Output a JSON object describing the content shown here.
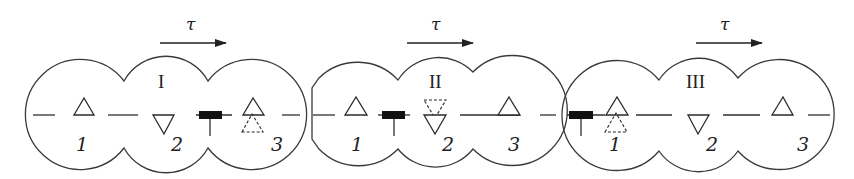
{
  "diagram": {
    "direction_symbol": "τ",
    "stroke_color": "#2a2a2a",
    "block_color": "#111111",
    "panels": [
      {
        "label": "I",
        "positions": [
          "1",
          "2",
          "3"
        ],
        "triangles": [
          {
            "position": "1",
            "orientation": "up",
            "style": "solid"
          },
          {
            "position": "2",
            "orientation": "down",
            "style": "solid"
          },
          {
            "position": "3",
            "orientation": "up",
            "style": "solid"
          },
          {
            "position": "3",
            "orientation": "up",
            "style": "dashed-below"
          }
        ],
        "block_position": "between 2 and 3"
      },
      {
        "label": "II",
        "positions": [
          "1",
          "2",
          "3"
        ],
        "triangles": [
          {
            "position": "1",
            "orientation": "up",
            "style": "solid"
          },
          {
            "position": "2",
            "orientation": "down",
            "style": "solid"
          },
          {
            "position": "2",
            "orientation": "down",
            "style": "dashed-above"
          },
          {
            "position": "3",
            "orientation": "up",
            "style": "solid"
          }
        ],
        "block_position": "between 1 and 2"
      },
      {
        "label": "III",
        "positions": [
          "1",
          "2",
          "3"
        ],
        "triangles": [
          {
            "position": "1",
            "orientation": "up",
            "style": "solid"
          },
          {
            "position": "1",
            "orientation": "up",
            "style": "dashed-below"
          },
          {
            "position": "2",
            "orientation": "down",
            "style": "solid"
          },
          {
            "position": "3",
            "orientation": "up",
            "style": "solid"
          }
        ],
        "block_position": "left of 1"
      }
    ]
  }
}
